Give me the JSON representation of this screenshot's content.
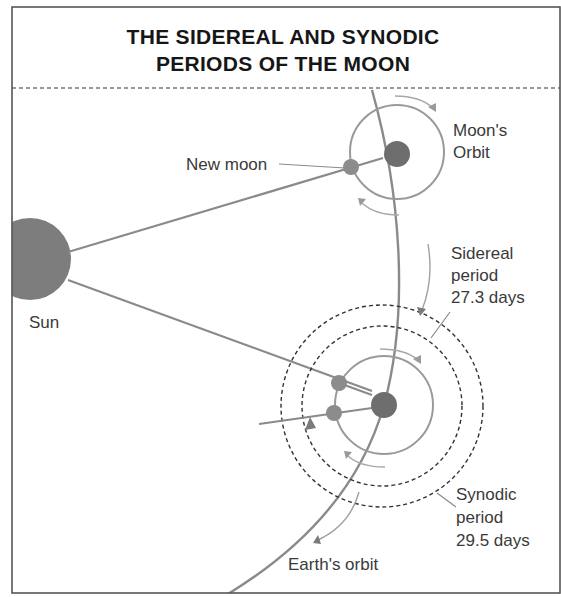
{
  "title": {
    "line1": "THE SIDEREAL AND SYNODIC",
    "line2": "PERIODS OF THE MOON"
  },
  "labels": {
    "sun": "Sun",
    "new_moon": "New moon",
    "moons_orbit_line1": "Moon's",
    "moons_orbit_line2": "Orbit",
    "sidereal_line1": "Sidereal",
    "sidereal_line2": "period",
    "sidereal_line3": "27.3 days",
    "synodic_line1": "Synodic",
    "synodic_line2": "period",
    "synodic_line3": "29.5 days",
    "earths_orbit": "Earth's orbit"
  },
  "colors": {
    "frame": "#555555",
    "title": "#161616",
    "label": "#3a3a3a",
    "sun": "#7d7d7d",
    "earth": "#6e6e6e",
    "moon": "#8c8c8c",
    "orbit_line": "#8a8a8a",
    "moon_orbit": "#9a9a9a",
    "arrow": "#a0a0a0",
    "dashed": "#333333"
  }
}
